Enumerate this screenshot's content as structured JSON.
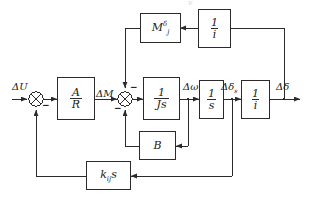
{
  "diagram": {
    "type": "control-block-diagram",
    "stroke_color": "#2b2b2b",
    "text_color": "#1a1a1a",
    "background": "#ffffff"
  },
  "blocks": [
    {
      "id": "gain_ar",
      "name": "gain-a-over-r-block",
      "numerator": "A",
      "denominator": "R",
      "kind": "fraction"
    },
    {
      "id": "inertia",
      "name": "inertia-block",
      "numerator": "1",
      "denominator": "Js",
      "kind": "fraction"
    },
    {
      "id": "integrator",
      "name": "integrator-block",
      "numerator": "1",
      "denominator": "s",
      "kind": "fraction"
    },
    {
      "id": "ratio_i_1",
      "name": "gear-ratio-block",
      "numerator": "1",
      "denominator": "i",
      "kind": "fraction"
    },
    {
      "id": "ratio_i_2",
      "name": "gear-ratio-feedback-block",
      "numerator": "1",
      "denominator": "i",
      "kind": "fraction"
    },
    {
      "id": "damping",
      "name": "damping-b-block",
      "label": "B",
      "kind": "plain"
    },
    {
      "id": "stab",
      "name": "stabilizer-gain-block",
      "base": "k",
      "subscript": "ij",
      "suffix": "s",
      "kind": "subscripted"
    },
    {
      "id": "m_delta",
      "name": "moment-coefficient-block",
      "base": "M",
      "superscript": "δ",
      "subscript": "j",
      "kind": "super-sub"
    }
  ],
  "signals": {
    "input": {
      "name": "input-signal-label",
      "text": "ΔU"
    },
    "torque": {
      "name": "torque-signal-label",
      "text": "ΔM"
    },
    "speed": {
      "name": "speed-signal-label",
      "text": "Δω"
    },
    "angle_s": {
      "name": "angle-s-signal-label",
      "base": "Δδ",
      "subscript": "s"
    },
    "output": {
      "name": "output-signal-label",
      "text": "Δδ"
    }
  },
  "summing_junctions": [
    {
      "id": "sum1",
      "name": "summing-junction-input",
      "signs": [
        "-"
      ]
    },
    {
      "id": "sum2",
      "name": "summing-junction-torque",
      "signs": [
        "-",
        "-"
      ]
    }
  ],
  "artifact": {
    "name": "scan-artifact",
    "text": "v"
  }
}
